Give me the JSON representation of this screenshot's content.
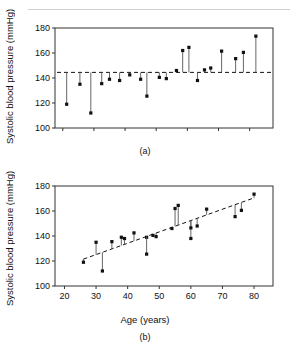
{
  "figure": {
    "panel_a_caption": "(a)",
    "panel_b_caption": "(b)"
  },
  "chart_data": [
    {
      "type": "scatter",
      "panel": "(a)",
      "title": "",
      "xlabel": "",
      "ylabel": "Systolic blood pressure (mmHg)",
      "ylim": [
        100,
        180
      ],
      "yticks": [
        100,
        120,
        140,
        160,
        180
      ],
      "ytick_labels": [
        "100",
        "120",
        "140",
        "160",
        "180"
      ],
      "xlim": [
        0,
        28
      ],
      "xticks": [
        1,
        5,
        9,
        13,
        17,
        21,
        25
      ],
      "xtick_labels": [
        "",
        "",
        "",
        "",
        "",
        "",
        ""
      ],
      "grid": false,
      "legend": null,
      "reference_line": {
        "kind": "horizontal-dashed",
        "value": 144.5,
        "label": "mean systolic blood pressure"
      },
      "description": "Observed systolic blood pressure for each subject with a vertical drop-line connecting the point to the horizontal mean reference line.",
      "x": [
        1.5,
        3.2,
        4.6,
        6.0,
        7.0,
        8.3,
        9.6,
        11.0,
        11.8,
        13.4,
        14.3,
        15.0,
        16.2,
        17.2,
        18.1,
        19.6,
        21.3,
        22.6,
        24.2,
        25.6
      ],
      "values": [
        119,
        135,
        112,
        135.5,
        139,
        138,
        142.5,
        139,
        125.5,
        140.5,
        139.5,
        146,
        162,
        164.5,
        138,
        146.5,
        148,
        161.5,
        155.5,
        160.5,
        173.5
      ],
      "points": [
        {
          "x": 1.5,
          "y": 119.0
        },
        {
          "x": 3.2,
          "y": 135.0
        },
        {
          "x": 4.6,
          "y": 112.0
        },
        {
          "x": 6.0,
          "y": 135.5
        },
        {
          "x": 7.0,
          "y": 139.0
        },
        {
          "x": 8.3,
          "y": 138.0
        },
        {
          "x": 9.6,
          "y": 142.5
        },
        {
          "x": 11.0,
          "y": 139.0
        },
        {
          "x": 11.8,
          "y": 125.5
        },
        {
          "x": 13.4,
          "y": 140.5
        },
        {
          "x": 14.3,
          "y": 139.5
        },
        {
          "x": 15.6,
          "y": 146.0
        },
        {
          "x": 16.4,
          "y": 162.0
        },
        {
          "x": 17.2,
          "y": 164.5
        },
        {
          "x": 18.3,
          "y": 138.0
        },
        {
          "x": 19.2,
          "y": 146.5
        },
        {
          "x": 20.0,
          "y": 148.0
        },
        {
          "x": 21.4,
          "y": 161.5
        },
        {
          "x": 23.2,
          "y": 155.5
        },
        {
          "x": 24.2,
          "y": 160.5
        },
        {
          "x": 25.8,
          "y": 173.5
        }
      ]
    },
    {
      "type": "scatter",
      "panel": "(b)",
      "title": "",
      "xlabel": "Age (years)",
      "ylabel": "Systolic blood pressure (mmHg)",
      "ylim": [
        100,
        180
      ],
      "yticks": [
        100,
        120,
        140,
        160,
        180
      ],
      "ytick_labels": [
        "100",
        "120",
        "140",
        "160",
        "180"
      ],
      "xlim": [
        17,
        86
      ],
      "xticks": [
        20,
        30,
        40,
        50,
        60,
        70,
        80
      ],
      "xtick_labels": [
        "20",
        "30",
        "40",
        "50",
        "60",
        "70",
        "80"
      ],
      "grid": false,
      "legend": null,
      "reference_line": {
        "kind": "regression-dashed",
        "label": "fitted regression line",
        "x_start": 26,
        "y_start": 121.5,
        "x_end": 80,
        "y_end": 170.5
      },
      "description": "Systolic blood pressure against age with the fitted regression line; vertical drop-lines show each residual.",
      "points": [
        {
          "x": 26,
          "y": 119.0
        },
        {
          "x": 30,
          "y": 135.0
        },
        {
          "x": 32,
          "y": 112.0
        },
        {
          "x": 35,
          "y": 135.5
        },
        {
          "x": 38,
          "y": 139.0
        },
        {
          "x": 39,
          "y": 138.0
        },
        {
          "x": 42,
          "y": 142.5
        },
        {
          "x": 46,
          "y": 139.0
        },
        {
          "x": 46,
          "y": 125.5
        },
        {
          "x": 48,
          "y": 140.5
        },
        {
          "x": 49,
          "y": 139.5
        },
        {
          "x": 54,
          "y": 146.0
        },
        {
          "x": 55,
          "y": 162.0
        },
        {
          "x": 56,
          "y": 164.5
        },
        {
          "x": 60,
          "y": 138.0
        },
        {
          "x": 60,
          "y": 146.5
        },
        {
          "x": 62,
          "y": 148.0
        },
        {
          "x": 65,
          "y": 161.5
        },
        {
          "x": 74,
          "y": 155.5
        },
        {
          "x": 76,
          "y": 160.5
        },
        {
          "x": 80,
          "y": 173.5
        }
      ]
    }
  ]
}
